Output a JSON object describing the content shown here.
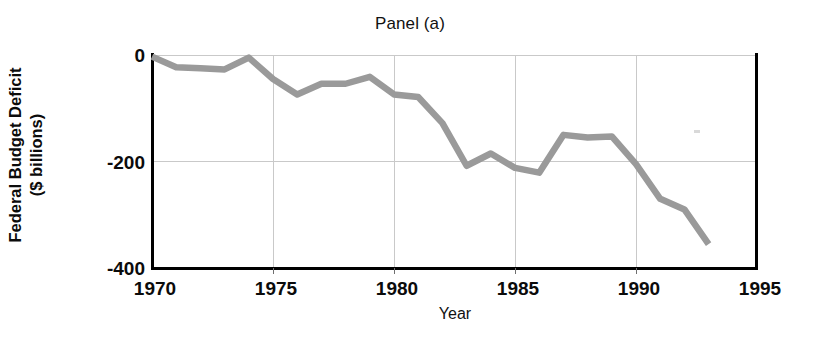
{
  "figure": {
    "title": "Panel (a)",
    "background_color": "#ffffff",
    "line_color": "#9a9a9a",
    "grid_color": "#c9c9c9",
    "axis_color": "#000000"
  },
  "axes": {
    "ylabel_line1": "Federal Budget Deficit",
    "ylabel_line2": "($ billions)",
    "xlabel": "Year",
    "yticks": [
      "0",
      "-200",
      "-400"
    ],
    "xticks": [
      "1970",
      "1975",
      "1980",
      "1985",
      "1990",
      "1995"
    ]
  },
  "chart_data": {
    "type": "line",
    "title": "Panel (a)",
    "xlabel": "Year",
    "ylabel": "Federal Budget Deficit ($ billions)",
    "xlim": [
      1970,
      1995
    ],
    "ylim": [
      -400,
      0
    ],
    "xticks": [
      1970,
      1975,
      1980,
      1985,
      1990,
      1995
    ],
    "yticks": [
      0,
      -200,
      -400
    ],
    "grid": true,
    "legend": false,
    "series": [
      {
        "name": "Federal Budget Deficit",
        "color": "#9a9a9a",
        "x": [
          1970,
          1971,
          1972,
          1973,
          1974,
          1975,
          1976,
          1977,
          1978,
          1979,
          1980,
          1981,
          1982,
          1983,
          1984,
          1985,
          1986,
          1987,
          1988,
          1989,
          1990,
          1991,
          1992,
          1993
        ],
        "values": [
          -3,
          -23,
          -25,
          -27,
          -5,
          -45,
          -74,
          -54,
          -54,
          -41,
          -74,
          -79,
          -128,
          -208,
          -185,
          -212,
          -221,
          -150,
          -155,
          -153,
          -205,
          -270,
          -290,
          -355
        ]
      }
    ]
  }
}
